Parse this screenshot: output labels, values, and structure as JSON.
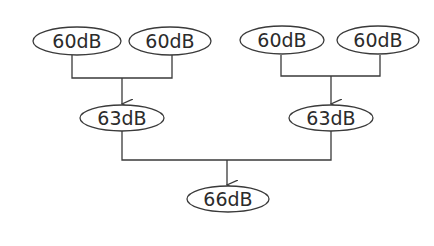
{
  "diagram": {
    "title": "",
    "nodes": [
      {
        "id": "a1",
        "label": "60dB",
        "level": 0
      },
      {
        "id": "a2",
        "label": "60dB",
        "level": 0
      },
      {
        "id": "b1",
        "label": "60dB",
        "level": 0
      },
      {
        "id": "b2",
        "label": "60dB",
        "level": 0
      },
      {
        "id": "a",
        "label": "63dB",
        "level": 1
      },
      {
        "id": "b",
        "label": "63dB",
        "level": 1
      },
      {
        "id": "total",
        "label": "66dB",
        "level": 2
      }
    ],
    "edges": [
      {
        "from": [
          "a1",
          "a2"
        ],
        "to": "a"
      },
      {
        "from": [
          "b1",
          "b2"
        ],
        "to": "b"
      },
      {
        "from": [
          "a",
          "b"
        ],
        "to": "total"
      }
    ],
    "colors": {
      "stroke": "#3a3a3a",
      "text": "#2b2b2b",
      "background": "#ffffff"
    }
  }
}
